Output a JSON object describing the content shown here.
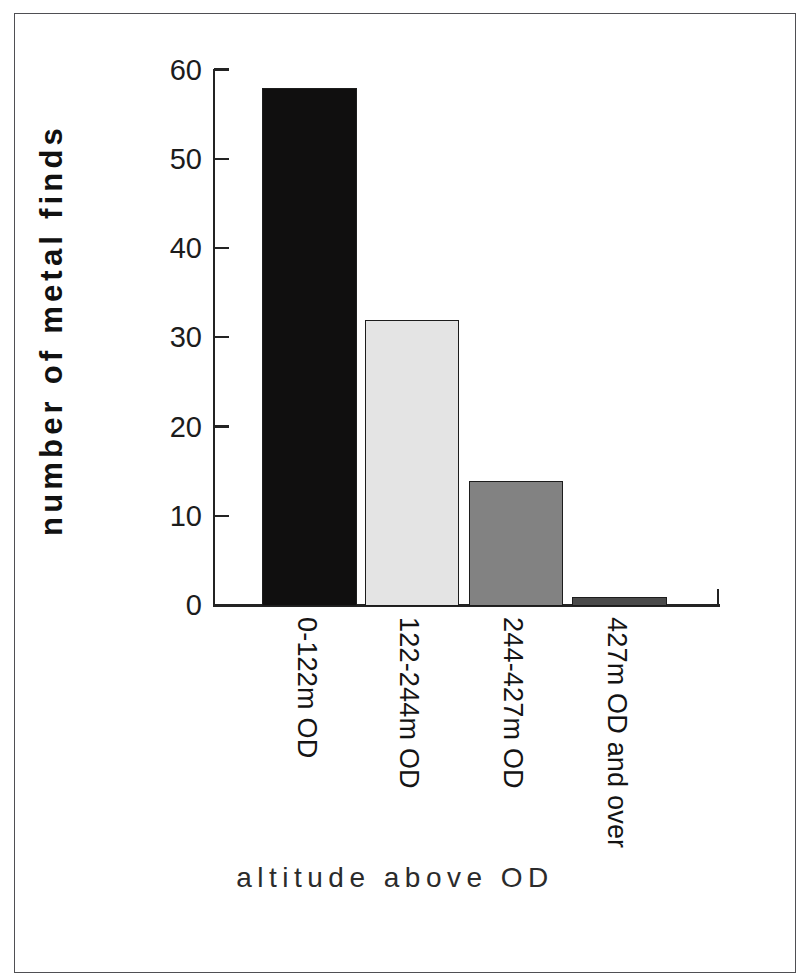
{
  "figure": {
    "background_color": "#ffffff",
    "frame_color": "#4f4f53"
  },
  "chart_data": {
    "type": "bar",
    "title": "",
    "subtitle": "",
    "xlabel": "altitude above OD",
    "ylabel": "number of metal finds",
    "categories": [
      "0-122m OD",
      "122-244m OD",
      "244-427m OD",
      "427m OD and over"
    ],
    "values": [
      58,
      32,
      14,
      1
    ],
    "bar_colors": [
      "#100f0f",
      "#e4e4e4",
      "#828282",
      "#4a4a4a"
    ],
    "bar_edge_color": "#1d1d1d",
    "ylim": [
      0,
      60
    ],
    "yticks": [
      0,
      10,
      20,
      30,
      40,
      50,
      60
    ],
    "ytick_labels": [
      "0",
      "10",
      "20",
      "30",
      "40",
      "50",
      "60"
    ],
    "grid": false,
    "legend": false,
    "legend_position": "none",
    "xtick_label_rotation": 90,
    "annotations": []
  }
}
